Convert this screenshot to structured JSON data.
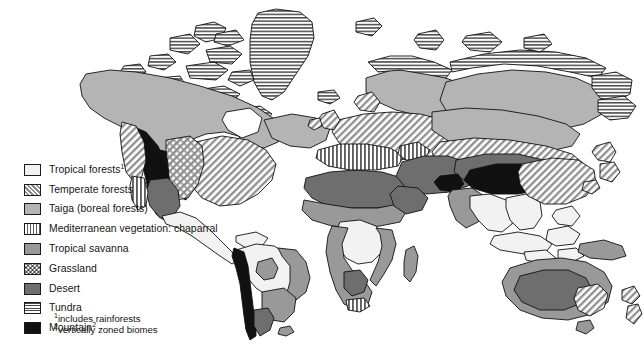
{
  "figure": {
    "background_color": "#ffffff",
    "width": 644,
    "height": 350
  },
  "legend": {
    "items": [
      {
        "label": "Tropical forests",
        "superscript": "1",
        "swatch": "tropical",
        "pattern": "solid-very-light-gray",
        "color": "#f2f2f2"
      },
      {
        "label": "Temperate forests",
        "superscript": "",
        "swatch": "temperate",
        "pattern": "diagonal-hatch",
        "color": "#8c8c8c"
      },
      {
        "label": "Taiga (boreal forests)",
        "superscript": "",
        "swatch": "taiga",
        "pattern": "solid-light-gray",
        "color": "#b4b4b4"
      },
      {
        "label": "Mediterranean vegetation: chaparral",
        "superscript": "",
        "swatch": "chaparral",
        "pattern": "vertical-stripes",
        "color": "#5f5f5f"
      },
      {
        "label": "Tropical savanna",
        "superscript": "",
        "swatch": "savanna",
        "pattern": "solid-medium-gray",
        "color": "#999999"
      },
      {
        "label": "Grassland",
        "superscript": "",
        "swatch": "grassland",
        "pattern": "cross-hatch",
        "color": "#8a8a8a"
      },
      {
        "label": "Desert",
        "superscript": "",
        "swatch": "desert",
        "pattern": "solid-dark-gray",
        "color": "#6e6e6e"
      },
      {
        "label": "Tundra",
        "superscript": "",
        "swatch": "tundra",
        "pattern": "horizontal-stripes",
        "color": "#4a4a4a"
      },
      {
        "label": "Mountain",
        "superscript": "2",
        "swatch": "mountain",
        "pattern": "solid-black",
        "color": "#111111"
      }
    ],
    "footnotes": [
      {
        "marker": "1",
        "text": "includes rainforests"
      },
      {
        "marker": "2",
        "text": "vertically zoned biomes"
      }
    ]
  },
  "map": {
    "outline_color": "#111111",
    "regions": [
      {
        "name": "greenland",
        "biome": "Tundra"
      },
      {
        "name": "arctic-canada",
        "biome": "Tundra"
      },
      {
        "name": "canada-taiga",
        "biome": "Taiga (boreal forests)"
      },
      {
        "name": "rocky-mountains",
        "biome": "Mountain"
      },
      {
        "name": "eastern-usa",
        "biome": "Temperate forests"
      },
      {
        "name": "great-plains",
        "biome": "Grassland"
      },
      {
        "name": "southwest-desert",
        "biome": "Desert"
      },
      {
        "name": "california-chaparral",
        "biome": "Mediterranean vegetation: chaparral"
      },
      {
        "name": "central-america",
        "biome": "Tropical forests"
      },
      {
        "name": "amazon-basin",
        "biome": "Tropical forests"
      },
      {
        "name": "andes",
        "biome": "Mountain"
      },
      {
        "name": "brazil-cerrado",
        "biome": "Tropical savanna"
      },
      {
        "name": "pampas",
        "biome": "Grassland"
      },
      {
        "name": "patagonia",
        "biome": "Desert"
      },
      {
        "name": "sahara",
        "biome": "Desert"
      },
      {
        "name": "sahel",
        "biome": "Tropical savanna"
      },
      {
        "name": "congo-basin",
        "biome": "Tropical forests"
      },
      {
        "name": "southern-africa",
        "biome": "Tropical savanna"
      },
      {
        "name": "kalahari",
        "biome": "Desert"
      },
      {
        "name": "cape-chaparral",
        "biome": "Mediterranean vegetation: chaparral"
      },
      {
        "name": "madagascar",
        "biome": "Tropical savanna"
      },
      {
        "name": "europe-temperate",
        "biome": "Temperate forests"
      },
      {
        "name": "mediterranean-basin",
        "biome": "Mediterranean vegetation: chaparral"
      },
      {
        "name": "scandinavia-taiga",
        "biome": "Taiga (boreal forests)"
      },
      {
        "name": "siberia-taiga",
        "biome": "Taiga (boreal forests)"
      },
      {
        "name": "arctic-russia",
        "biome": "Tundra"
      },
      {
        "name": "central-asia-steppe",
        "biome": "Temperate forests"
      },
      {
        "name": "middle-east-desert",
        "biome": "Desert"
      },
      {
        "name": "gobi-desert",
        "biome": "Desert"
      },
      {
        "name": "tibetan-plateau",
        "biome": "Mountain"
      },
      {
        "name": "india-savanna",
        "biome": "Tropical savanna"
      },
      {
        "name": "southeast-asia",
        "biome": "Tropical forests"
      },
      {
        "name": "indonesia",
        "biome": "Tropical forests"
      },
      {
        "name": "china-temperate",
        "biome": "Temperate forests"
      },
      {
        "name": "new-guinea",
        "biome": "Tropical forests"
      },
      {
        "name": "australia-desert",
        "biome": "Desert"
      },
      {
        "name": "australia-savanna",
        "biome": "Tropical savanna"
      },
      {
        "name": "australia-southeast",
        "biome": "Temperate forests"
      },
      {
        "name": "new-zealand",
        "biome": "Temperate forests"
      }
    ]
  }
}
